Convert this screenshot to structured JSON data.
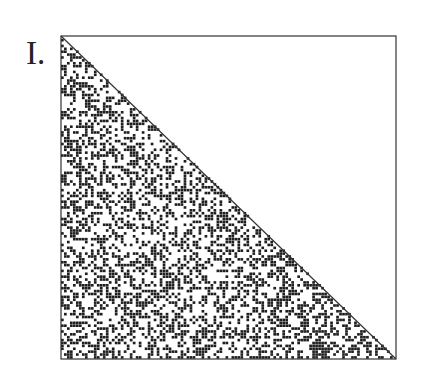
{
  "panel": {
    "label": "I.",
    "description": "Square matrix plot; lower-left triangle filled with random binary (black/white) pixels, upper-right triangle empty",
    "colors": {
      "ink": "#1e1e1e",
      "frame": "#333333",
      "background": "#ffffff"
    },
    "grid": {
      "cells": 112,
      "density": 0.42
    },
    "box": {
      "x": 0,
      "y": 0,
      "size": 336
    }
  }
}
